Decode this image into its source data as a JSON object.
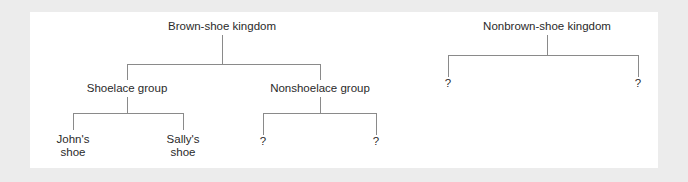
{
  "diagram": {
    "type": "taxonomy-tree",
    "trees": [
      {
        "label": "Brown-shoe kingdom",
        "children": [
          {
            "label": "Shoelace group",
            "children": [
              {
                "label_line1": "John's",
                "label_line2": "shoe"
              },
              {
                "label_line1": "Sally's",
                "label_line2": "shoe"
              }
            ]
          },
          {
            "label": "Nonshoelace group",
            "children": [
              {
                "label": "?"
              },
              {
                "label": "?"
              }
            ]
          }
        ]
      },
      {
        "label": "Nonbrown-shoe kingdom",
        "children": [
          {
            "label": "?"
          },
          {
            "label": "?"
          }
        ]
      }
    ],
    "colors": {
      "background": "#ececec",
      "panel": "#ffffff",
      "line": "#8a8a8a",
      "text": "#2a2a2a"
    }
  }
}
